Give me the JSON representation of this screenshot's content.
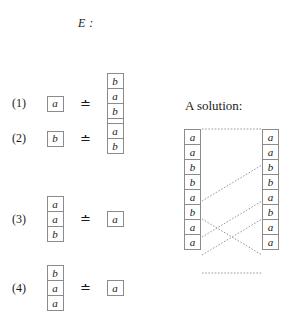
{
  "system": {
    "title": "E :",
    "relation_symbol": "≐",
    "equations": [
      {
        "number": "(1)",
        "lhs": [
          "a"
        ],
        "rhs": [
          "b",
          "a",
          "b",
          "a"
        ]
      },
      {
        "number": "(2)",
        "lhs": [
          "b"
        ],
        "rhs": [
          "a",
          "b"
        ]
      },
      {
        "number": "(3)",
        "lhs": [
          "a",
          "a",
          "b"
        ],
        "rhs": [
          "a"
        ]
      },
      {
        "number": "(4)",
        "lhs": [
          "b",
          "a",
          "a"
        ],
        "rhs": [
          "a"
        ]
      }
    ]
  },
  "solution": {
    "heading": "A solution:",
    "left_word": [
      "a",
      "a",
      "b",
      "b",
      "a",
      "b",
      "a",
      "a"
    ],
    "right_word": [
      "a",
      "a",
      "b",
      "b",
      "a",
      "b",
      "a",
      "a"
    ],
    "links": [
      {
        "from_y": 0,
        "to_y": 0
      },
      {
        "from_y": 72,
        "to_y": 36
      },
      {
        "from_y": 108,
        "to_y": 72
      },
      {
        "from_y": 126,
        "to_y": 90
      },
      {
        "from_y": 90,
        "to_y": 126
      },
      {
        "from_y": 144,
        "to_y": 144
      }
    ]
  },
  "colors": {
    "text": "#1a1a1a",
    "cell_border": "#8b8b8b",
    "link_line": "#9a9a9a",
    "background": "#ffffff"
  }
}
